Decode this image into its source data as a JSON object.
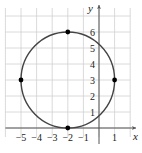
{
  "chart_data": {
    "type": "scatter",
    "title": "",
    "xlabel": "x",
    "ylabel": "y",
    "xlim": [
      -6,
      2
    ],
    "ylim": [
      -0.5,
      7.5
    ],
    "grid": true,
    "x_ticks": [
      -5,
      -4,
      -3,
      -2,
      -1,
      1
    ],
    "x_tick_labels": [
      "−5",
      "−4",
      "−3",
      "−2",
      "−1",
      "1"
    ],
    "y_ticks": [
      1,
      2,
      3,
      4,
      5,
      6
    ],
    "y_tick_labels": [
      "1",
      "2",
      "3",
      "4",
      "5",
      "6"
    ],
    "curves": [
      {
        "name": "circle",
        "shape": "circle",
        "center": [
          -2,
          3
        ],
        "radius": 3,
        "color": "#444444"
      }
    ],
    "points": [
      {
        "x": -2,
        "y": 6
      },
      {
        "x": -5,
        "y": 3
      },
      {
        "x": 1,
        "y": 3
      },
      {
        "x": -2,
        "y": 0
      }
    ],
    "colors": {
      "grid": "#d0d0d0",
      "axis": "#555555",
      "curve": "#444444",
      "point": "#000000"
    }
  }
}
